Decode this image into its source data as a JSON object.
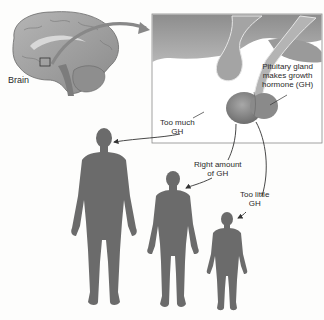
{
  "diagram": {
    "type": "illustration"
  },
  "labels": {
    "brain": "Brain",
    "pituitary_line1": "Pituitary gland",
    "pituitary_line2": "makes growth",
    "pituitary_line3": "hormone (GH)",
    "too_much_line1": "Too much",
    "too_much_line2": "GH",
    "right_line1": "Right amount",
    "right_line2": "of GH",
    "too_little_line1": "Too little",
    "too_little_line2": "GH"
  },
  "figures": [
    {
      "name": "tall",
      "condition": "Too much GH"
    },
    {
      "name": "normal",
      "condition": "Right amount of GH"
    },
    {
      "name": "short",
      "condition": "Too little GH"
    }
  ],
  "colors": {
    "silhouette": "#6b6b6b",
    "inset_bg": "#ffffff",
    "inset_border": "#8a8a8a",
    "arrow": "#333333",
    "brain": "#9c9c9c"
  }
}
